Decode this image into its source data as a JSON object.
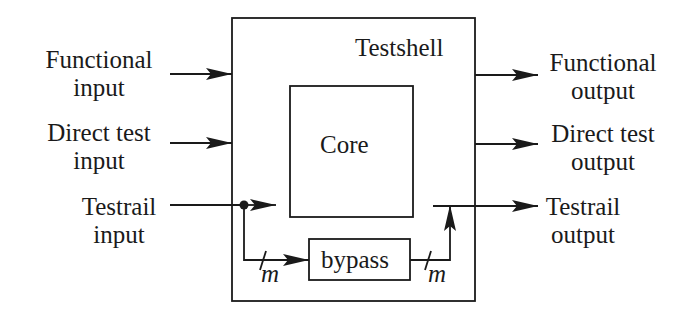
{
  "diagram": {
    "shell_label": "Testshell",
    "core_label": "Core",
    "bypass_label": "bypass",
    "bus_width_label": "m",
    "inputs": [
      {
        "line1": "Functional",
        "line2": "input"
      },
      {
        "line1": "Direct test",
        "line2": "input"
      },
      {
        "line1": "Testrail",
        "line2": "input"
      }
    ],
    "outputs": [
      {
        "line1": "Functional",
        "line2": "output"
      },
      {
        "line1": "Direct test",
        "line2": "output"
      },
      {
        "line1": "Testrail",
        "line2": "output"
      }
    ],
    "colors": {
      "stroke": "#1a1a1a",
      "background": "#ffffff"
    }
  }
}
